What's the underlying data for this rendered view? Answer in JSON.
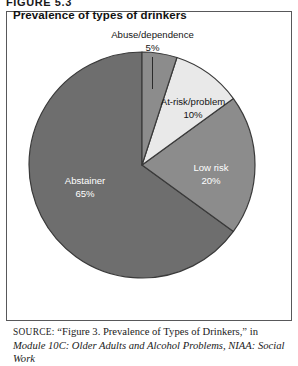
{
  "figure": {
    "number_label": "FIGURE 5.3",
    "title": "Prevalence of types of drinkers"
  },
  "colors": {
    "abstainer": "#6e6e6e",
    "low_risk": "#8c8c8c",
    "at_risk": "#e9e9e9",
    "abuse": "#8c8c8c",
    "outline": "#3a3a3a",
    "box_border": "#58585a",
    "label_light": "#ffffff",
    "label_dark": "#141414"
  },
  "source": {
    "kicker": "SOURCE:",
    "line1_plain": " “Figure 3. Prevalence of Types of Drinkers,” in ",
    "line1_italic": "Module",
    "line2_italic": "10C: Older Adults and Alcohol Problems, NIAA: Social Work"
  },
  "chart_data": {
    "type": "pie",
    "title": "Prevalence of types of drinkers",
    "categories": [
      "Abuse/dependence",
      "At-risk/problem",
      "Low risk",
      "Abstainer"
    ],
    "values": [
      5,
      10,
      20,
      65
    ],
    "value_labels": [
      "5%",
      "10%",
      "20%",
      "65%"
    ],
    "units": "percent",
    "start_angle_deg": 0,
    "direction": "clockwise",
    "legend": "none",
    "grid": false,
    "slices": [
      {
        "name": "Abuse/dependence",
        "value": 5,
        "label": "Abuse/dependence",
        "value_label": "5%",
        "color": "#8c8c8c",
        "label_placement": "callout-top",
        "label_color": "#141414"
      },
      {
        "name": "At-risk/problem",
        "value": 10,
        "label": "At-risk/problem",
        "value_label": "10%",
        "color": "#e9e9e9",
        "label_placement": "outside-right",
        "label_color": "#141414"
      },
      {
        "name": "Low risk",
        "value": 20,
        "label": "Low risk",
        "value_label": "20%",
        "color": "#8c8c8c",
        "label_placement": "inside",
        "label_color": "#ffffff"
      },
      {
        "name": "Abstainer",
        "value": 65,
        "label": "Abstainer",
        "value_label": "65%",
        "color": "#6e6e6e",
        "label_placement": "inside",
        "label_color": "#ffffff"
      }
    ]
  }
}
